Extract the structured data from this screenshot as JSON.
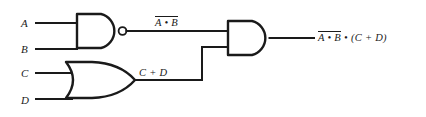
{
  "diagram": {
    "background_color": "#ffffff",
    "line_color": "#1a1a1a"
  },
  "inputs": [
    {
      "label": "A",
      "name": "input-label-a"
    },
    {
      "label": "B",
      "name": "input-label-b"
    },
    {
      "label": "C",
      "name": "input-label-c"
    },
    {
      "label": "D",
      "name": "input-label-d"
    }
  ],
  "gates": [
    {
      "type": "nand",
      "name": "nand-gate",
      "inputs": [
        "A",
        "B"
      ],
      "inverted_output": true
    },
    {
      "type": "or",
      "name": "or-gate",
      "inputs": [
        "C",
        "D"
      ],
      "inverted_output": false
    },
    {
      "type": "and",
      "name": "and-gate",
      "inputs": [
        "nand-gate",
        "or-gate"
      ],
      "inverted_output": false
    }
  ],
  "wire_labels": {
    "nand_output": {
      "overbarred": "A • B",
      "plain": ""
    },
    "or_output": "C + D",
    "final_output": {
      "overbarred": "A • B",
      "plain": " • (C + D)"
    }
  }
}
